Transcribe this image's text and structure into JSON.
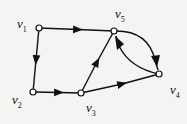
{
  "diagram": {
    "type": "directed-graph",
    "nodes": [
      {
        "id": "v1",
        "label": "v",
        "sub": "1",
        "x": 39,
        "y": 28
      },
      {
        "id": "v2",
        "label": "v",
        "sub": "2",
        "x": 33,
        "y": 92
      },
      {
        "id": "v3",
        "label": "v",
        "sub": "3",
        "x": 81,
        "y": 93
      },
      {
        "id": "v4",
        "label": "v",
        "sub": "4",
        "x": 159,
        "y": 74
      },
      {
        "id": "v5",
        "label": "v",
        "sub": "5",
        "x": 114,
        "y": 31
      }
    ],
    "edges": [
      {
        "from": "v1",
        "to": "v5"
      },
      {
        "from": "v1",
        "to": "v2"
      },
      {
        "from": "v2",
        "to": "v3"
      },
      {
        "from": "v3",
        "to": "v5"
      },
      {
        "from": "v3",
        "to": "v4"
      },
      {
        "from": "v5",
        "to": "v4",
        "curved": true
      },
      {
        "from": "v4",
        "to": "v5",
        "curved": true
      }
    ],
    "colors": {
      "stroke": "#111111",
      "node_fill": "#ffffff",
      "background": "#f4f4f2"
    }
  }
}
